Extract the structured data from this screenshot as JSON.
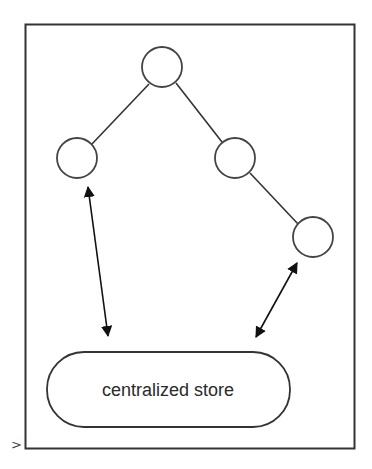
{
  "diagram": {
    "store_label": "centralized store",
    "corner_marker": ">",
    "nodes": [
      {
        "id": "root",
        "label": ""
      },
      {
        "id": "left-child",
        "label": ""
      },
      {
        "id": "right-child",
        "label": ""
      },
      {
        "id": "right-grandchild",
        "label": ""
      }
    ],
    "edges": [
      {
        "from": "root",
        "to": "left-child",
        "type": "line"
      },
      {
        "from": "root",
        "to": "right-child",
        "type": "line"
      },
      {
        "from": "right-child",
        "to": "right-grandchild",
        "type": "line"
      },
      {
        "from": "left-child",
        "to": "centralized store",
        "type": "bidirectional-arrow"
      },
      {
        "from": "right-grandchild",
        "to": "centralized store",
        "type": "bidirectional-arrow"
      }
    ],
    "colors": {
      "stroke": "#333333",
      "background": "#ffffff"
    }
  }
}
